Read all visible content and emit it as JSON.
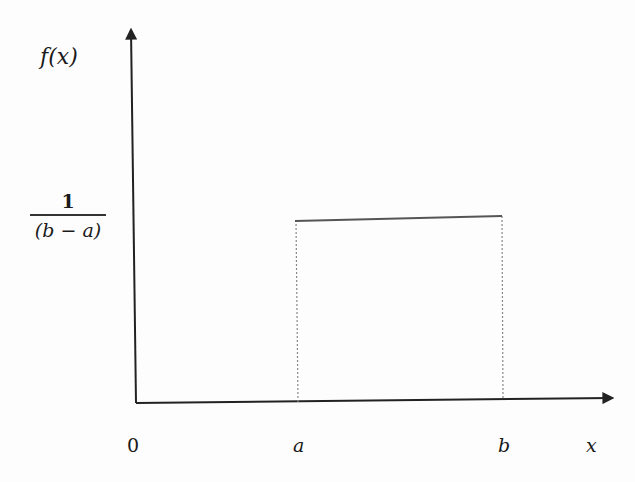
{
  "diagram": {
    "y_axis_label": "f(x)",
    "x_axis_label": "x",
    "height_label": {
      "numerator": "1",
      "denominator": "(b − a)"
    },
    "x_ticks": [
      {
        "label": "0",
        "italic": false
      },
      {
        "label": "a",
        "italic": true
      },
      {
        "label": "b",
        "italic": true
      }
    ],
    "colors": {
      "axis": "#222222",
      "density_line": "#555555",
      "dotted_guides": "#888888"
    }
  }
}
